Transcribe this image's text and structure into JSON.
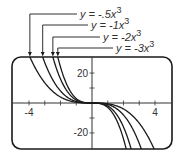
{
  "chart_data": {
    "type": "line",
    "title": "",
    "xlabel": "",
    "ylabel": "",
    "xlim": [
      -5.08,
      5.08
    ],
    "ylim": [
      -30.7,
      30.7
    ],
    "grid": false,
    "x_ticks": [
      -4,
      -3,
      -2,
      -1,
      1,
      2,
      3,
      4
    ],
    "x_tick_labels": [
      {
        "value": -4,
        "label": "-4"
      },
      {
        "value": 4,
        "label": "4"
      }
    ],
    "y_ticks": [
      -20,
      -10,
      10,
      20
    ],
    "y_tick_labels": [
      {
        "value": 20,
        "label": "20"
      },
      {
        "value": -20,
        "label": "-20"
      }
    ],
    "series": [
      {
        "name": "y = -.5x³",
        "coefficient": -0.5,
        "label_main": "y = -.5x",
        "label_exp": "3"
      },
      {
        "name": "y = -1x³",
        "coefficient": -1,
        "label_main": "y = -1x",
        "label_exp": "3"
      },
      {
        "name": "y = -2x³",
        "coefficient": -2,
        "label_main": "y = -2x",
        "label_exp": "3"
      },
      {
        "name": "y = -3x³",
        "coefficient": -3,
        "label_main": "y = -3x",
        "label_exp": "3"
      }
    ],
    "legend_position": "top, with leader arrows to curves"
  },
  "colors": {
    "curve": "#1a1a1a",
    "frame": "#1a1a1a",
    "axis": "#333333",
    "text": "#333333"
  }
}
